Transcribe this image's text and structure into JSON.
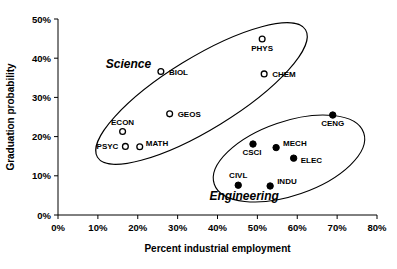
{
  "chart_data": {
    "type": "scatter",
    "title": "",
    "xlabel": "Percent industrial employment",
    "ylabel": "Graduation probability",
    "xlim": [
      0,
      80
    ],
    "ylim": [
      0,
      50
    ],
    "xticks": [
      "0%",
      "10%",
      "20%",
      "30%",
      "40%",
      "50%",
      "60%",
      "70%",
      "80%"
    ],
    "xtick_values": [
      0,
      10,
      20,
      30,
      40,
      50,
      60,
      70,
      80
    ],
    "yticks": [
      "0%",
      "10%",
      "20%",
      "30%",
      "40%",
      "50%"
    ],
    "ytick_values": [
      0,
      10,
      20,
      30,
      40,
      50
    ],
    "grid": false,
    "legend_position": "none",
    "marker_styles": {
      "Science": "open-circle",
      "Engineering": "filled-circle"
    },
    "series": [
      {
        "name": "Science",
        "marker": "open-circle",
        "points": [
          {
            "label": "PHYS",
            "x": 51.2,
            "y": 44.9,
            "label_dx": 0,
            "label_dy": 12,
            "label_anchor": "middle"
          },
          {
            "label": "CHEM",
            "x": 51.7,
            "y": 36.0,
            "label_dx": 8,
            "label_dy": 3,
            "label_anchor": "start"
          },
          {
            "label": "BIOL",
            "x": 25.8,
            "y": 36.6,
            "label_dx": 8,
            "label_dy": 3,
            "label_anchor": "start"
          },
          {
            "label": "GEOS",
            "x": 28.0,
            "y": 25.8,
            "label_dx": 8,
            "label_dy": 3,
            "label_anchor": "start"
          },
          {
            "label": "ECON",
            "x": 16.2,
            "y": 21.3,
            "label_dx": 0,
            "label_dy": -7,
            "label_anchor": "middle"
          },
          {
            "label": "PSYC",
            "x": 16.9,
            "y": 17.5,
            "label_dx": -7,
            "label_dy": 3,
            "label_anchor": "end"
          },
          {
            "label": "MATH",
            "x": 20.5,
            "y": 17.4,
            "label_dx": 6,
            "label_dy": -1,
            "label_anchor": "start"
          }
        ]
      },
      {
        "name": "Engineering",
        "marker": "filled-circle",
        "points": [
          {
            "label": "CENG",
            "x": 68.9,
            "y": 25.5,
            "label_dx": 0,
            "label_dy": 11,
            "label_anchor": "middle"
          },
          {
            "label": "MECH",
            "x": 54.7,
            "y": 17.2,
            "label_dx": 7,
            "label_dy": -2,
            "label_anchor": "start"
          },
          {
            "label": "CSCI",
            "x": 48.9,
            "y": 18.1,
            "label_dx": -1,
            "label_dy": 11,
            "label_anchor": "middle"
          },
          {
            "label": "ELEC",
            "x": 59.1,
            "y": 14.5,
            "label_dx": 7,
            "label_dy": 5,
            "label_anchor": "start"
          },
          {
            "label": "CIVL",
            "x": 45.2,
            "y": 7.6,
            "label_dx": 0,
            "label_dy": -7,
            "label_anchor": "middle"
          },
          {
            "label": "INDU",
            "x": 53.2,
            "y": 7.4,
            "label_dx": 7,
            "label_dy": -2,
            "label_anchor": "start"
          }
        ]
      }
    ],
    "annotations": [
      {
        "text": "Science",
        "x": 12.0,
        "y": 37.5,
        "style": "italic-bold"
      },
      {
        "text": "Engineering",
        "x": 38.0,
        "y": 3.8,
        "style": "italic-bold"
      }
    ],
    "clusters": [
      {
        "name": "Science",
        "shape": "ellipse",
        "cx": 201.5,
        "cy": 93.5,
        "rx": 122,
        "ry": 36,
        "rotation": -31.5
      },
      {
        "name": "Engineering",
        "shape": "ellipse",
        "cx": 289,
        "cy": 158.5,
        "rx": 79,
        "ry": 37,
        "rotation": -19
      }
    ]
  },
  "axes": {
    "x_origin_px": 58,
    "y_origin_px": 215,
    "px_per_x_percent": 3.9875,
    "px_per_y_percent": 3.92
  }
}
